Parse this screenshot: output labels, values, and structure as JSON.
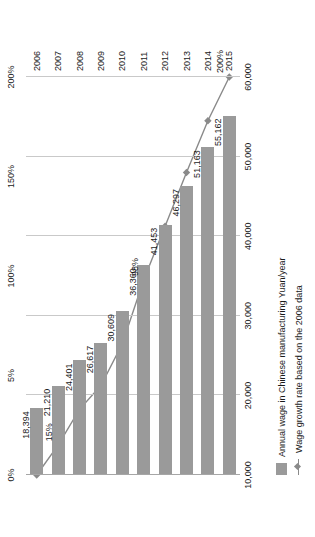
{
  "chart_data": {
    "type": "bar",
    "orientation": "rotated-90-ccw",
    "title": "",
    "categories": [
      "2006",
      "2007",
      "2008",
      "2009",
      "2010",
      "2011",
      "2012",
      "2013",
      "2014",
      "2015"
    ],
    "series": [
      {
        "name": "Annual wage in Chinese manufacturing Yuan/year",
        "type": "bar",
        "color": "#9a9a9a",
        "values": [
          18394,
          21210,
          24401,
          26617,
          30609,
          36360,
          41453,
          46297,
          51163,
          55162
        ],
        "labels": [
          "18,394",
          "21,210",
          "24,401",
          "26,617",
          "30,609",
          "36,360",
          "41,453",
          "46,297",
          "51,163",
          "55,162"
        ]
      },
      {
        "name": "Wage growth rate based on the 2006 data",
        "type": "line",
        "color": "#8a8a8a",
        "values": [
          0,
          15,
          33,
          45,
          66,
          98,
          125,
          152,
          178,
          200
        ],
        "point_labels": [
          {
            "category": "2007",
            "text": "15%"
          },
          {
            "category": "2011",
            "text": "98%"
          },
          {
            "category": "2015",
            "text": "200%"
          }
        ]
      }
    ],
    "primary_axis": {
      "name": "Annual wage (Yuan/year)",
      "ticks": [
        "10,000",
        "20,000",
        "30,000",
        "40,000",
        "50,000",
        "60,000"
      ],
      "tick_values": [
        10000,
        20000,
        30000,
        40000,
        50000,
        60000
      ],
      "min": 10000,
      "max": 60000
    },
    "secondary_axis": {
      "name": "Wage growth rate",
      "ticks": [
        "0%",
        "5%",
        "100%",
        "150%",
        "200%"
      ],
      "tick_values": [
        0,
        50,
        100,
        150,
        200
      ],
      "min": 0,
      "max": 200
    },
    "grid": true,
    "legend_position": "bottom",
    "legend": [
      {
        "label": "Annual wage in Chinese manufacturing Yuan/year",
        "marker": "bar-swatch",
        "color": "#9a9a9a"
      },
      {
        "label": "Wage growth rate based on the 2006 data",
        "marker": "line-diamond",
        "color": "#8a8a8a"
      }
    ]
  }
}
